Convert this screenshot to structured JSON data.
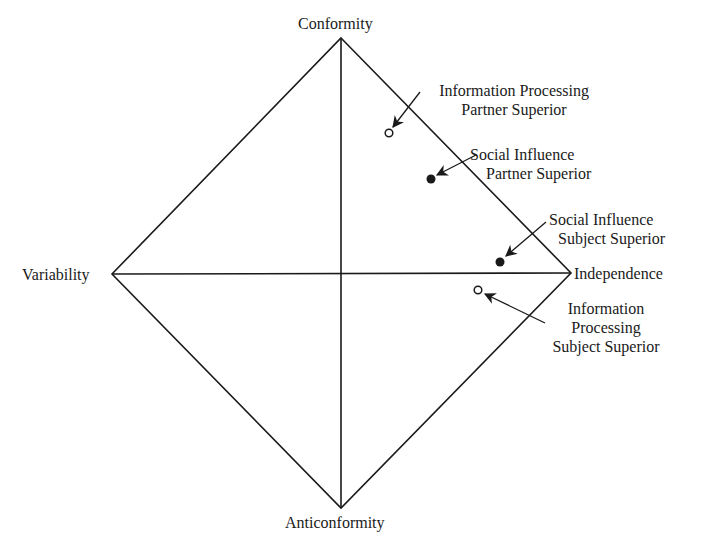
{
  "diagram": {
    "type": "diamond-response-model",
    "vertices": {
      "top": {
        "label": "Conformity",
        "x": 341,
        "y": 38
      },
      "left": {
        "label": "Variability",
        "x": 112,
        "y": 274
      },
      "right": {
        "label": "Independence",
        "x": 571,
        "y": 273
      },
      "bottom": {
        "label": "Anticonformity",
        "x": 341,
        "y": 508
      }
    },
    "points": [
      {
        "id": "ip-partner",
        "label_lines": [
          "Information Processing",
          "Partner Superior"
        ],
        "marker": "open",
        "x": 389,
        "y": 133
      },
      {
        "id": "si-partner",
        "label_lines": [
          "Social Influence",
          "Partner Superior"
        ],
        "marker": "filled",
        "x": 431,
        "y": 179
      },
      {
        "id": "si-subject",
        "label_lines": [
          "Social Influence",
          "Subject Superior"
        ],
        "marker": "filled",
        "x": 500,
        "y": 262
      },
      {
        "id": "ip-subject",
        "label_lines": [
          "Information",
          "Processing",
          "Subject Superior"
        ],
        "marker": "open",
        "x": 478,
        "y": 290
      }
    ]
  }
}
